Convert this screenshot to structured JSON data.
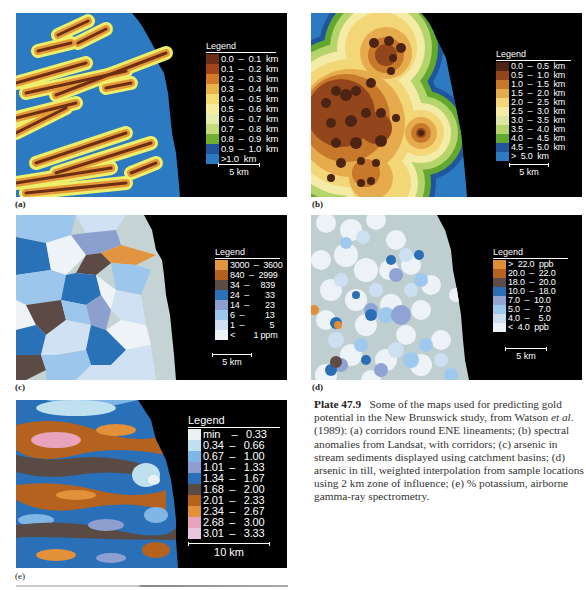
{
  "figure": {
    "plate_number": "Plate 47.9",
    "caption_text": "Some of the maps used for predicting gold potential in the New Brunswick study, from Watson ",
    "caption_italic": "et al",
    "caption_rest": ". (1989): (a) corridors round ENE lineaments; (b) spectral anomalies from Landsat, with corridors; (c) arsenic in stream sediments displayed using catchment basins; (d) arsenic in till, weighted interpolation from sample locations using 2 km zone of influence; (e) % potassium, airborne gamma-ray spectrometry."
  },
  "panels": {
    "a": {
      "label": "(a)",
      "legend_title": "Legend",
      "scale_label": "5 km",
      "legend": [
        {
          "label": "0.0  –  0.1  km",
          "color": "#6e2e14"
        },
        {
          "label": "0.1  –  0.2  km",
          "color": "#a1461a"
        },
        {
          "label": "0.2  –  0.3  km",
          "color": "#d27a2a"
        },
        {
          "label": "0.3  –  0.4  km",
          "color": "#eab24a"
        },
        {
          "label": "0.4  –  0.5  km",
          "color": "#f3dc74"
        },
        {
          "label": "0.5  –  0.6  km",
          "color": "#f6ee9c"
        },
        {
          "label": "0.6  –  0.7  km",
          "color": "#e6ecab"
        },
        {
          "label": "0.7  –  0.8  km",
          "color": "#c5db7a"
        },
        {
          "label": "0.8  –  0.9  km",
          "color": "#6fae33"
        },
        {
          "label": "0.9  –  1.0  km",
          "color": "#21559b"
        },
        {
          "label": ">1.0  km",
          "color": "#2c7bc2"
        }
      ]
    },
    "b": {
      "label": "(b)",
      "legend_title": "Legend",
      "scale_label": "5 km",
      "legend": [
        {
          "label": "0.0  –  0.5  km",
          "color": "#4d2414"
        },
        {
          "label": "0.5  –  1.0  km",
          "color": "#93461c"
        },
        {
          "label": "1.0  –  1.5  km",
          "color": "#c8782a"
        },
        {
          "label": "1.5  –  2.0  km",
          "color": "#e6ab4c"
        },
        {
          "label": "2.0  –  2.5  km",
          "color": "#f2d678"
        },
        {
          "label": "2.5  –  3.0  km",
          "color": "#f4eca6"
        },
        {
          "label": "3.0  –  3.5  km",
          "color": "#dfe6a4"
        },
        {
          "label": "3.5  –  4.0  km",
          "color": "#b6d46c"
        },
        {
          "label": "4.0  –  4.5  km",
          "color": "#62a72e"
        },
        {
          "label": "4.5  –  5.0  km",
          "color": "#21559b"
        },
        {
          "label": ">  5.0  km",
          "color": "#2c7bc2"
        }
      ]
    },
    "c": {
      "label": "(c)",
      "legend_title": "Legend",
      "scale_label": "5 km",
      "legend": [
        {
          "label": "3000  –  3600",
          "color": "#e29540"
        },
        {
          "label": "840  –  2999",
          "color": "#b2621f"
        },
        {
          "label": "34  –     839",
          "color": "#5c4a44"
        },
        {
          "label": "24  –       33",
          "color": "#2a72b8"
        },
        {
          "label": "14  –       23",
          "color": "#8ca0d0"
        },
        {
          "label": "6  –         13",
          "color": "#9cc6ec"
        },
        {
          "label": "1  –           5",
          "color": "#cfe1f2"
        },
        {
          "label": "<        1 ppm",
          "color": "#eef3f8"
        }
      ]
    },
    "d": {
      "label": "(d)",
      "legend_title": "Legend",
      "scale_label": "5 km",
      "legend": [
        {
          "label": ">  22.0  ppb",
          "color": "#e08e36"
        },
        {
          "label": "20.0  –  22.0",
          "color": "#b5621f"
        },
        {
          "label": "18.0  –  20.0",
          "color": "#5f4c48"
        },
        {
          "label": "10.0  –  18.0",
          "color": "#2a6eb5"
        },
        {
          "label": "7.0  –  10.0",
          "color": "#8fa3d4"
        },
        {
          "label": "5.0  –    7.0",
          "color": "#9fc8ee"
        },
        {
          "label": "4.0  –    5.0",
          "color": "#cde0f1"
        },
        {
          "label": "<  4.0  ppb",
          "color": "#edf2f6"
        }
      ]
    },
    "e": {
      "label": "(e)",
      "legend_title": "Legend",
      "scale_label": "10  km",
      "legend": [
        {
          "label": "min    –   0.33",
          "color": "#eaf2f4"
        },
        {
          "label": "0.34  –   0.66",
          "color": "#bfe0ee"
        },
        {
          "label": "0.67  –   1.00",
          "color": "#7fb6e6"
        },
        {
          "label": "1.01  –   1.33",
          "color": "#8c9fcf"
        },
        {
          "label": "1.34  –   1.67",
          "color": "#2a70b8"
        },
        {
          "label": "1.68  –   2.00",
          "color": "#5a4a44"
        },
        {
          "label": "2.01  –   2.33",
          "color": "#b5621f"
        },
        {
          "label": "2.34  –   2.67",
          "color": "#e2903a"
        },
        {
          "label": "2.68  –   3.00",
          "color": "#e7a4bc"
        },
        {
          "label": "3.01  –   3.33",
          "color": "#eac6de"
        }
      ]
    }
  }
}
